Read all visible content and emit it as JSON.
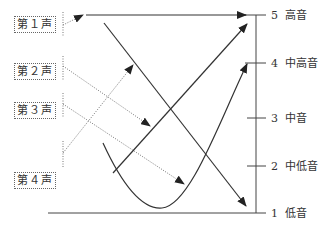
{
  "tone_labels": [
    {
      "text": "第１声",
      "top": 16
    },
    {
      "text": "第２声",
      "top": 63
    },
    {
      "text": "第３声",
      "top": 102
    },
    {
      "text": "第４声",
      "top": 172
    }
  ],
  "scale": [
    {
      "num": "5",
      "name": "高音",
      "y": 15
    },
    {
      "num": "4",
      "name": "中高音",
      "y": 63
    },
    {
      "num": "3",
      "name": "中音",
      "y": 118
    },
    {
      "num": "2",
      "name": "中低音",
      "y": 166
    },
    {
      "num": "1",
      "name": "低音",
      "y": 213
    }
  ],
  "colors": {
    "line": "#333333",
    "dotted": "#777777"
  }
}
